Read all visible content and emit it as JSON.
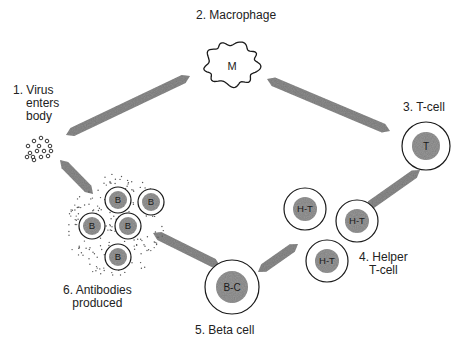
{
  "steps": [
    {
      "id": "virus",
      "number": "1.",
      "lines": [
        "1. Virus",
        "enters",
        "body"
      ]
    },
    {
      "id": "macrophage",
      "number": "2.",
      "lines": [
        "2. Macrophage"
      ],
      "cell_label": "M"
    },
    {
      "id": "tcell",
      "number": "3.",
      "lines": [
        "3. T-cell"
      ],
      "cell_label": "T"
    },
    {
      "id": "helper",
      "number": "4.",
      "lines": [
        "4. Helper",
        "T-cell"
      ],
      "cell_label": "H-T",
      "count": 3
    },
    {
      "id": "beta",
      "number": "5.",
      "lines": [
        "5. Beta cell"
      ],
      "cell_label": "B-C"
    },
    {
      "id": "antibodies",
      "number": "6.",
      "lines": [
        "6. Antibodies",
        "produced"
      ],
      "cell_label": "B",
      "count": 5
    }
  ],
  "arrows": [
    {
      "from": "virus",
      "to": "macrophage"
    },
    {
      "from": "macrophage",
      "to": "tcell"
    },
    {
      "from": "tcell",
      "to": "helper"
    },
    {
      "from": "helper",
      "to": "beta"
    },
    {
      "from": "beta",
      "to": "antibodies"
    },
    {
      "from": "virus",
      "to": "antibodies"
    }
  ],
  "colors": {
    "arrow": "#8f8f8f",
    "nucleus": "#9a9a9a",
    "outline": "#1a1a1a",
    "background": "#ffffff"
  }
}
